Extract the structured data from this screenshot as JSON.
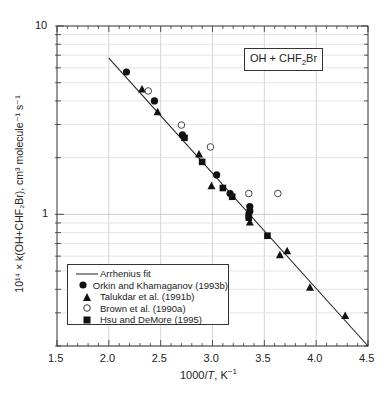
{
  "chart_data": {
    "type": "scatter",
    "title": "OH + CHF2Br",
    "inset_label": {
      "prefix": "OH + CHF",
      "sub": "2",
      "suffix": "Br"
    },
    "xlabel": "1000/T, K^-1",
    "ylabel": "10^14 × k(OH+CHF2Br), cm^3 molecule^-1 s^-1",
    "xlim": [
      1.5,
      4.5
    ],
    "ylim": [
      0.2,
      10
    ],
    "yscale": "log",
    "grid": true,
    "legend_position": "lower left",
    "x_ticks": [
      "1.5",
      "2.0",
      "2.5",
      "3.0",
      "3.5",
      "4.0",
      "4.5"
    ],
    "y_ticks": [
      "1",
      "10"
    ],
    "series": [
      {
        "name": "Arrhenius fit",
        "kind": "line",
        "points": [
          [
            2.0,
            6.76
          ],
          [
            4.5,
            0.2
          ]
        ]
      },
      {
        "name": "Orkin and Khamaganov (1993b)",
        "marker": "filled-circle",
        "points": [
          [
            2.17,
            5.7
          ],
          [
            2.44,
            4.0
          ],
          [
            2.71,
            2.64
          ],
          [
            3.04,
            1.62
          ],
          [
            3.17,
            1.29
          ],
          [
            3.36,
            1.1
          ],
          [
            3.36,
            1.04
          ]
        ]
      },
      {
        "name": "Talukdar et al. (1991b)",
        "marker": "filled-triangle",
        "points": [
          [
            2.32,
            4.63
          ],
          [
            2.47,
            3.5
          ],
          [
            2.87,
            2.09
          ],
          [
            2.99,
            1.42
          ],
          [
            3.36,
            0.91
          ],
          [
            3.65,
            0.61
          ],
          [
            3.72,
            0.64
          ],
          [
            3.94,
            0.41
          ],
          [
            4.28,
            0.29
          ]
        ]
      },
      {
        "name": "Brown et al. (1990a)",
        "marker": "open-circle",
        "points": [
          [
            2.38,
            4.52
          ],
          [
            2.7,
            2.98
          ],
          [
            2.98,
            2.28
          ],
          [
            3.35,
            1.29
          ],
          [
            3.63,
            1.29
          ]
        ]
      },
      {
        "name": "Hsu and DeMore (1995)",
        "marker": "filled-square",
        "points": [
          [
            2.73,
            2.55
          ],
          [
            2.9,
            1.9
          ],
          [
            3.1,
            1.38
          ],
          [
            3.19,
            1.24
          ],
          [
            3.35,
            0.99
          ],
          [
            3.35,
            0.96
          ],
          [
            3.53,
            0.77
          ]
        ]
      }
    ]
  },
  "legend": {
    "items": [
      {
        "label": "Arrhenius fit"
      },
      {
        "label": "Orkin and Khamaganov (1993b)"
      },
      {
        "label": "Talukdar et al. (1991b)"
      },
      {
        "label": "Brown et al. (1990a)"
      },
      {
        "label": "Hsu and DeMore (1995)"
      }
    ]
  },
  "axes": {
    "x_title_prefix": "1000/",
    "x_title_var": "T",
    "x_title_suffix": ", K",
    "x_title_sup": "−1",
    "y_title": "10¹⁴ × k(OH+CHF₂Br), cm³ molecule⁻¹ s⁻¹"
  }
}
